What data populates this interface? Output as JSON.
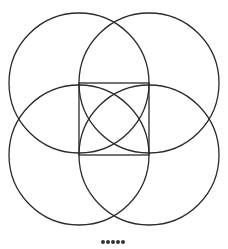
{
  "diagram": {
    "type": "geometric figure",
    "stroke_color": "#2a2a2a",
    "square": {
      "x": 79,
      "y": 83,
      "width": 70,
      "height": 72
    },
    "circles": [
      {
        "cx": 79,
        "cy": 83,
        "r": 70
      },
      {
        "cx": 149,
        "cy": 83,
        "r": 70
      },
      {
        "cx": 79,
        "cy": 155,
        "r": 70
      },
      {
        "cx": 149,
        "cy": 155,
        "r": 70
      }
    ],
    "inner_arcs": [
      {
        "cx": 79,
        "cy": 83,
        "r": 70
      },
      {
        "cx": 149,
        "cy": 155,
        "r": 70
      }
    ]
  },
  "pagination": {
    "dots": 5
  }
}
